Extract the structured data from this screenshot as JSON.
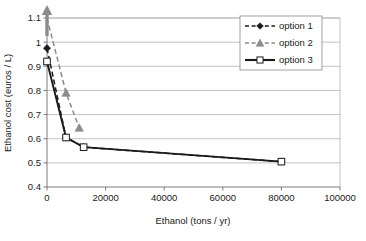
{
  "chart_data": {
    "type": "line",
    "title": "",
    "xlabel": "Ethanol (tons / yr)",
    "ylabel": "Ethanol cost (euros / L)",
    "xlim": [
      0,
      100000
    ],
    "ylim": [
      0.4,
      1.1
    ],
    "xticks": [
      0,
      20000,
      40000,
      60000,
      80000,
      100000
    ],
    "xtick_labels": [
      "0",
      "20000",
      "40000",
      "60000",
      "80000",
      "100000"
    ],
    "yticks": [
      0.4,
      0.5,
      0.6,
      0.7,
      0.8,
      0.9,
      1.0,
      1.1
    ],
    "ytick_labels": [
      "0.4",
      "0.5",
      "0.6",
      "0.7",
      "0.8",
      "0.9",
      "1",
      "1.1"
    ],
    "grid": "horizontal",
    "legend_position": "top-right",
    "series": [
      {
        "name": "option 1",
        "label": "option 1",
        "marker": "filled-diamond",
        "linestyle": "dashed",
        "color": "#1a1a1a",
        "x": [
          0,
          6500,
          12500,
          80000
        ],
        "y": [
          0.975,
          0.605,
          0.565,
          0.505
        ]
      },
      {
        "name": "option 2",
        "label": "option 2",
        "marker": "filled-triangle",
        "linestyle": "dashed",
        "color": "#8c8c8c",
        "x": [
          0,
          6500,
          11000
        ],
        "y": [
          1.13,
          0.79,
          0.645
        ],
        "annotation": "off-scale arrow above 1.1 at x = 0"
      },
      {
        "name": "option 3",
        "label": "option 3",
        "marker": "open-square",
        "linestyle": "solid",
        "color": "#1a1a1a",
        "x": [
          0,
          6500,
          12500,
          80000
        ],
        "y": [
          0.92,
          0.605,
          0.565,
          0.505
        ]
      }
    ]
  },
  "legend": {
    "entries": [
      {
        "label": "option 1"
      },
      {
        "label": "option 2"
      },
      {
        "label": "option 3"
      }
    ]
  },
  "colors": {
    "series1": "#1a1a1a",
    "series2": "#8c8c8c",
    "series3": "#1a1a1a",
    "grid": "#a9a9a9",
    "axis": "#6e6e6e",
    "background": "#ffffff"
  }
}
